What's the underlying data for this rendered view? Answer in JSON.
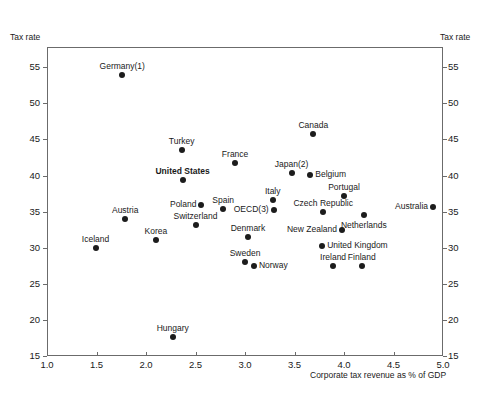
{
  "chart_data": {
    "type": "scatter",
    "title": "",
    "xlabel": "Corporate tax revenue as % of GDP",
    "ylabel_left": "Tax rate",
    "ylabel_right": "Tax rate",
    "xlim": [
      1.0,
      5.0
    ],
    "ylim": [
      15,
      57.8
    ],
    "xticks": [
      "1.0",
      "1.5",
      "2.0",
      "2.5",
      "3.0",
      "3.5",
      "4.0",
      "4.5",
      "5.0"
    ],
    "xtick_values": [
      1.0,
      1.5,
      2.0,
      2.5,
      3.0,
      3.5,
      4.0,
      4.5,
      5.0
    ],
    "yticks": [
      "15",
      "20",
      "25",
      "30",
      "35",
      "40",
      "45",
      "50",
      "55"
    ],
    "ytick_values": [
      15,
      20,
      25,
      30,
      35,
      40,
      45,
      50,
      55
    ],
    "grid": false,
    "legend": "none",
    "marker_color": "#1c1c1c",
    "axis_color": "#6b6b6b",
    "points": [
      {
        "label": "Germany(1)",
        "x": 1.76,
        "y": 53.9,
        "label_pos": "top",
        "bold": false
      },
      {
        "label": "Turkey",
        "x": 2.36,
        "y": 43.6,
        "label_pos": "top",
        "bold": false
      },
      {
        "label": "United States",
        "x": 2.37,
        "y": 39.4,
        "label_pos": "top",
        "bold": true
      },
      {
        "label": "France",
        "x": 2.9,
        "y": 41.7,
        "label_pos": "top",
        "bold": false
      },
      {
        "label": "Canada",
        "x": 3.69,
        "y": 45.8,
        "label_pos": "top",
        "bold": false
      },
      {
        "label": "Japan(2)",
        "x": 3.47,
        "y": 40.3,
        "label_pos": "top",
        "bold": false
      },
      {
        "label": "Belgium",
        "x": 3.66,
        "y": 40.1,
        "label_pos": "right",
        "bold": false
      },
      {
        "label": "Portugal",
        "x": 4.0,
        "y": 37.2,
        "label_pos": "top",
        "bold": false
      },
      {
        "label": "Italy",
        "x": 3.28,
        "y": 36.6,
        "label_pos": "top",
        "bold": false
      },
      {
        "label": "Spain",
        "x": 2.78,
        "y": 35.3,
        "label_pos": "top",
        "bold": false
      },
      {
        "label": "Poland",
        "x": 2.56,
        "y": 35.9,
        "label_pos": "left",
        "bold": false
      },
      {
        "label": "OECD(3)",
        "x": 3.29,
        "y": 35.2,
        "label_pos": "left",
        "bold": false
      },
      {
        "label": "Czech Republic",
        "x": 3.79,
        "y": 34.9,
        "label_pos": "top",
        "bold": false
      },
      {
        "label": "Australia",
        "x": 4.9,
        "y": 35.7,
        "label_pos": "left",
        "bold": false
      },
      {
        "label": "Austria",
        "x": 1.79,
        "y": 34.0,
        "label_pos": "top",
        "bold": false
      },
      {
        "label": "Switzerland",
        "x": 2.5,
        "y": 33.1,
        "label_pos": "top",
        "bold": false
      },
      {
        "label": "Netherlands",
        "x": 4.2,
        "y": 34.5,
        "label_pos": "bottom",
        "bold": false
      },
      {
        "label": "New Zealand",
        "x": 3.98,
        "y": 32.5,
        "label_pos": "left",
        "bold": false
      },
      {
        "label": "Denmark",
        "x": 3.03,
        "y": 31.5,
        "label_pos": "top",
        "bold": false
      },
      {
        "label": "Korea",
        "x": 2.1,
        "y": 31.0,
        "label_pos": "top",
        "bold": false
      },
      {
        "label": "United Kingdom",
        "x": 3.78,
        "y": 30.3,
        "label_pos": "right",
        "bold": false
      },
      {
        "label": "Iceland",
        "x": 1.49,
        "y": 29.9,
        "label_pos": "top",
        "bold": false
      },
      {
        "label": "Sweden",
        "x": 3.0,
        "y": 28.0,
        "label_pos": "top",
        "bold": false
      },
      {
        "label": "Norway",
        "x": 3.09,
        "y": 27.5,
        "label_pos": "right",
        "bold": false
      },
      {
        "label": "Ireland",
        "x": 3.89,
        "y": 27.5,
        "label_pos": "top",
        "bold": false
      },
      {
        "label": "Finland",
        "x": 4.18,
        "y": 27.5,
        "label_pos": "top",
        "bold": false
      },
      {
        "label": "Hungary",
        "x": 2.27,
        "y": 17.6,
        "label_pos": "top",
        "bold": false
      }
    ]
  }
}
